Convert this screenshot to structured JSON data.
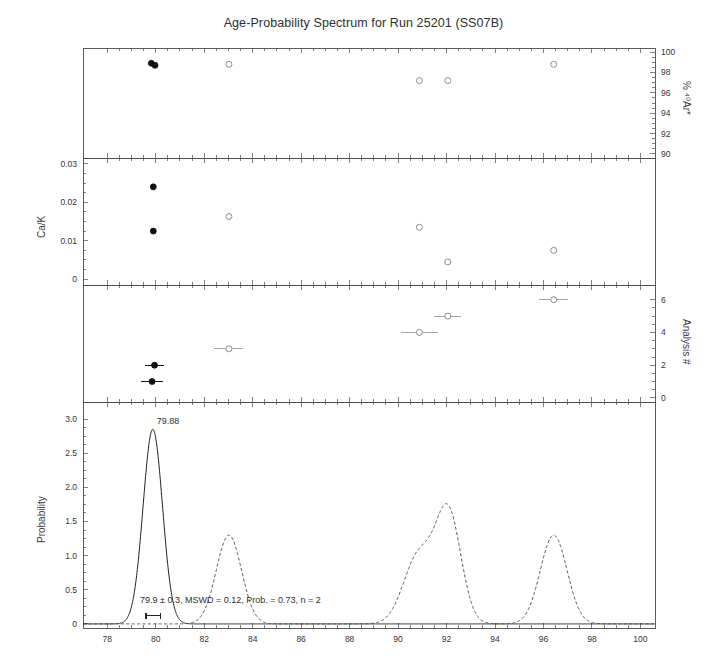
{
  "title": "Age-Probability Spectrum for Run 25201 (SS07B)",
  "axes": {
    "x": {
      "label": "",
      "ticks": [
        "78",
        "80",
        "82",
        "84",
        "86",
        "88",
        "90",
        "92",
        "94",
        "96",
        "98",
        "100"
      ],
      "min": 77.0,
      "max": 100.6
    },
    "panel1": {
      "label": "% ⁴⁰Ar*",
      "label_side": "right",
      "ticks": [
        "100",
        "98",
        "96",
        "94",
        "92",
        "90"
      ],
      "tick_values": [
        100,
        98,
        96,
        94,
        92,
        90
      ],
      "min": 89.6,
      "max": 100.4
    },
    "panel2": {
      "label": "Ca/K",
      "label_side": "left",
      "ticks": [
        "0.03",
        "0.02",
        "0.01",
        "0"
      ],
      "tick_values": [
        0.03,
        0.02,
        0.01,
        0
      ],
      "min": -0.0015,
      "max": 0.0315
    },
    "panel3": {
      "label": "Analysis #",
      "label_side": "right",
      "ticks": [
        "6",
        "4",
        "2",
        "0"
      ],
      "tick_values": [
        6,
        4,
        2,
        0
      ],
      "min": -0.25,
      "max": 6.9
    },
    "panel4": {
      "label": "Probability",
      "label_side": "left",
      "ticks": [
        "3.0",
        "2.5",
        "2.0",
        "1.5",
        "1.0",
        "0.5",
        "0"
      ],
      "tick_values": [
        3.0,
        2.5,
        2.0,
        1.5,
        1.0,
        0.5,
        0
      ],
      "min": -0.06,
      "max": 3.25
    }
  },
  "annotations": {
    "peak_label": "79.88",
    "peak_label_x": 79.88,
    "peak_label_y": 2.95,
    "stats": "79.9 ± 0.3, MSWD = 0.12, Prob. = 0.73, n = 2",
    "stats_x": 79.35,
    "stats_y": 0.33,
    "mean_bar": {
      "center": 79.9,
      "err": 0.3,
      "y": 0.12
    }
  },
  "chart_data": {
    "type": "scatter",
    "title": "Age-Probability Spectrum for Run 25201 (SS07B)",
    "xlabel": "Age (Ma)",
    "xlim": [
      77.0,
      100.6
    ],
    "grid": false,
    "legend": "none",
    "panels": [
      {
        "name": "radiogenic-yield",
        "ylabel": "% 40Ar*",
        "ylim": [
          89.6,
          100.4
        ],
        "yticks": [
          100,
          98,
          96,
          94,
          92,
          90
        ],
        "points": [
          {
            "x": 79.82,
            "y": 98.9,
            "filled": true
          },
          {
            "x": 79.97,
            "y": 98.7,
            "filled": true
          },
          {
            "x": 83.02,
            "y": 98.8,
            "filled": false
          },
          {
            "x": 90.88,
            "y": 97.2,
            "filled": false
          },
          {
            "x": 92.05,
            "y": 97.2,
            "filled": false
          },
          {
            "x": 96.42,
            "y": 98.8,
            "filled": false
          }
        ]
      },
      {
        "name": "ca-k-ratio",
        "ylabel": "Ca/K",
        "ylim": [
          -0.0015,
          0.0315
        ],
        "yticks": [
          0.03,
          0.02,
          0.01,
          0
        ],
        "points": [
          {
            "x": 79.9,
            "y": 0.024,
            "filled": true
          },
          {
            "x": 79.9,
            "y": 0.0125,
            "filled": true
          },
          {
            "x": 83.02,
            "y": 0.0163,
            "filled": false
          },
          {
            "x": 90.88,
            "y": 0.0135,
            "filled": false
          },
          {
            "x": 92.05,
            "y": 0.0045,
            "filled": false
          },
          {
            "x": 96.42,
            "y": 0.0075,
            "filled": false
          }
        ]
      },
      {
        "name": "analysis-number",
        "ylabel": "Analysis #",
        "ylim": [
          -0.25,
          6.9
        ],
        "yticks": [
          6,
          4,
          2,
          0
        ],
        "points": [
          {
            "x": 79.85,
            "y": 1.0,
            "err": 0.45,
            "filled": true
          },
          {
            "x": 79.95,
            "y": 2.0,
            "err": 0.4,
            "filled": true
          },
          {
            "x": 83.02,
            "y": 3.0,
            "err": 0.6,
            "filled": false
          },
          {
            "x": 90.88,
            "y": 4.0,
            "err": 0.75,
            "filled": false
          },
          {
            "x": 92.05,
            "y": 5.0,
            "err": 0.55,
            "filled": false
          },
          {
            "x": 96.42,
            "y": 6.0,
            "err": 0.6,
            "filled": false
          }
        ]
      },
      {
        "name": "probability-density",
        "ylabel": "Probability",
        "ylim": [
          -0.06,
          3.25
        ],
        "yticks": [
          3.0,
          2.5,
          2.0,
          1.5,
          1.0,
          0.5,
          0
        ],
        "curves": [
          {
            "style": "solid",
            "name": "mean-age-curve",
            "peaks": [
              {
                "center": 79.88,
                "height": 2.85,
                "width": 0.4
              }
            ]
          },
          {
            "style": "dashed",
            "name": "all-analyses-curve",
            "peaks": [
              {
                "center": 83.02,
                "height": 1.3,
                "width": 0.52
              },
              {
                "center": 90.85,
                "height": 1.0,
                "width": 0.62
              },
              {
                "center": 92.08,
                "height": 1.6,
                "width": 0.52
              },
              {
                "center": 96.42,
                "height": 1.3,
                "width": 0.55
              }
            ]
          }
        ]
      }
    ]
  },
  "colors": {
    "axis": "#4a4a4a",
    "text": "#333333",
    "marker_filled": "#111111",
    "marker_open": "#8d8d8d",
    "curve_solid": "#222222",
    "curve_dashed": "#444444"
  }
}
